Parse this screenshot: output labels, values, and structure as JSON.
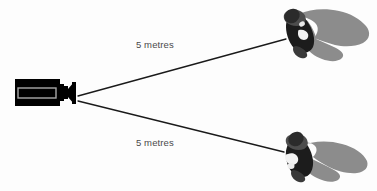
{
  "diagram": {
    "background_color": "#fdfdfd",
    "labels": {
      "top_distance": "5 metres",
      "bottom_distance": "5 metres"
    },
    "colors": {
      "line": "#1a1a1a",
      "camera_body": "#000000",
      "camera_inner_outline": "#a8a8a8",
      "figure_dark": "#1c1c1c",
      "figure_mid": "#4d4d4d",
      "figure_light": "#f2f2f2",
      "shadow": "#8c8c8c",
      "text": "#4a4a4a"
    },
    "elements": {
      "camera_name": "video camera",
      "top_subject_name": "person top view with shadow",
      "bottom_subject_name": "person top view with shadow",
      "top_sightline_name": "sight line to top subject",
      "bottom_sightline_name": "sight line to bottom subject"
    },
    "geometry": {
      "camera_origin_x": 78,
      "camera_origin_y": 98,
      "top_target_x": 285,
      "top_target_y": 40,
      "bottom_target_x": 283,
      "bottom_target_y": 152
    }
  }
}
